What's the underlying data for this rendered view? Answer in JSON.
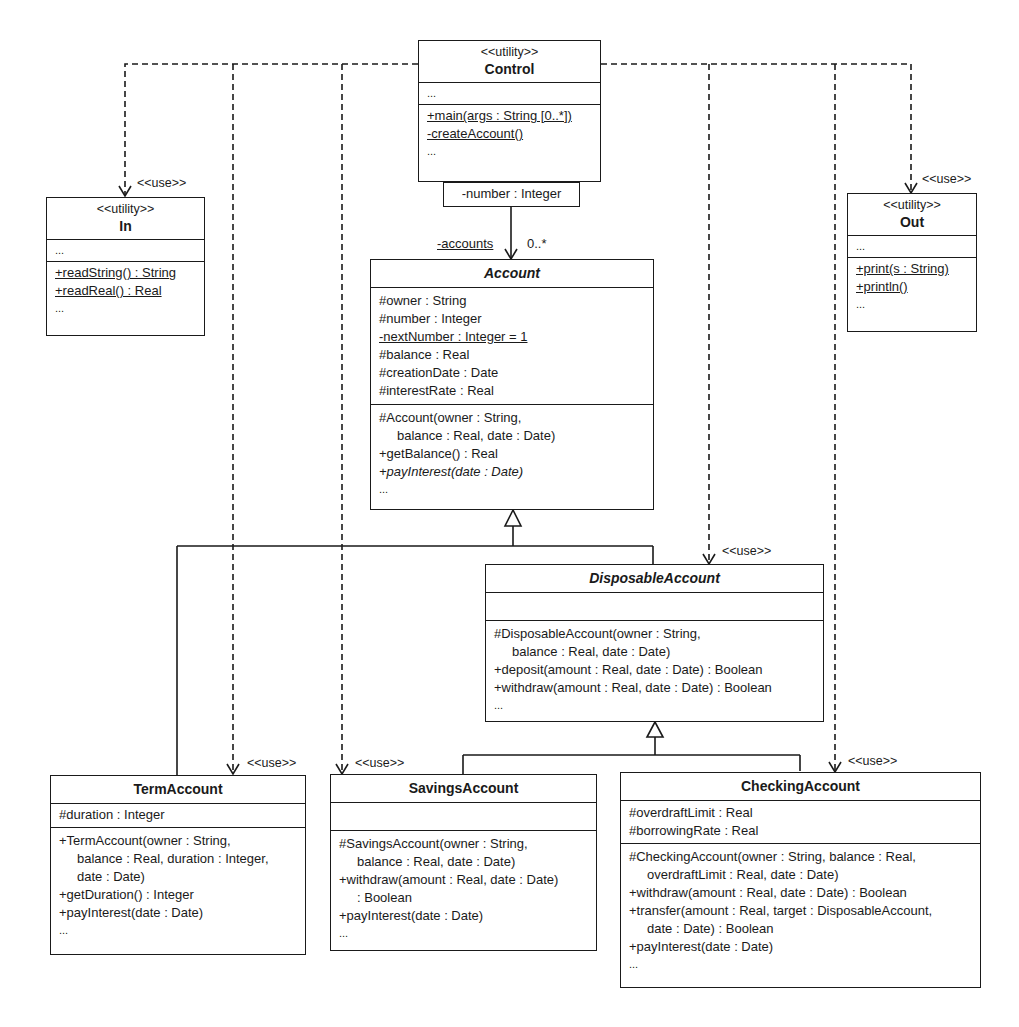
{
  "diagram": {
    "type": "UML class diagram",
    "classes": {
      "control": {
        "stereotype": "<<utility>>",
        "name": "Control",
        "attributes": [
          "..."
        ],
        "operations": [
          "+main(args : String [0..*])",
          "-createAccount()",
          "..."
        ]
      },
      "in": {
        "stereotype": "<<utility>>",
        "name": "In",
        "attributes": [
          "..."
        ],
        "operations": [
          "+readString() : String",
          "+readReal() : Real",
          "..."
        ]
      },
      "out": {
        "stereotype": "<<utility>>",
        "name": "Out",
        "attributes": [
          "..."
        ],
        "operations": [
          "+print(s : String)",
          "+println()",
          "..."
        ]
      },
      "account": {
        "name": "Account",
        "abstract": true,
        "attributes": [
          "#owner : String",
          "#number : Integer",
          "-nextNumber : Integer = 1",
          "#balance : Real",
          "#creationDate : Date",
          "#interestRate : Real"
        ],
        "operations": [
          "#Account(owner :  String,",
          "balance : Real, date : Date)",
          "+getBalance() : Real",
          "+payInterest(date : Date)",
          "..."
        ]
      },
      "disposable": {
        "name": "DisposableAccount",
        "abstract": true,
        "attributes": [],
        "operations": [
          "#DisposableAccount(owner :  String,",
          "balance : Real, date : Date)",
          "+deposit(amount : Real, date : Date) : Boolean",
          "+withdraw(amount : Real, date : Date) : Boolean",
          "..."
        ]
      },
      "term": {
        "name": "TermAccount",
        "attributes": [
          "#duration : Integer"
        ],
        "operations": [
          "+TermAccount(owner :  String,",
          "balance : Real, duration : Integer,",
          "date : Date)",
          "+getDuration() : Integer",
          "+payInterest(date : Date)",
          "..."
        ]
      },
      "savings": {
        "name": "SavingsAccount",
        "attributes": [],
        "operations": [
          "#SavingsAccount(owner :  String,",
          "balance : Real, date : Date)",
          "+withdraw(amount : Real, date : Date)",
          ": Boolean",
          "+payInterest(date : Date)",
          "..."
        ]
      },
      "checking": {
        "name": "CheckingAccount",
        "attributes": [
          "#overdraftLimit : Real",
          "#borrowingRate : Real"
        ],
        "operations": [
          "#CheckingAccount(owner :  String, balance : Real,",
          "overdraftLimit : Real, date : Date)",
          "+withdraw(amount : Real, date : Date) : Boolean",
          "+transfer(amount : Real, target : DisposableAccount,",
          "date : Date) : Boolean",
          "+payInterest(date : Date)",
          "..."
        ]
      }
    },
    "association": {
      "qualifier": "-number : Integer",
      "role": "-accounts",
      "multiplicity": "0..*"
    },
    "use_label": "<<use>>"
  }
}
